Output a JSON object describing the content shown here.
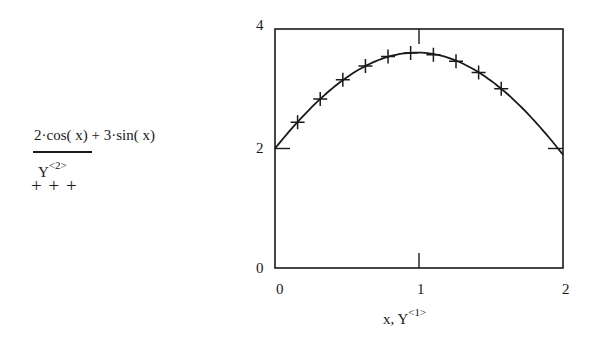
{
  "legend": {
    "series1_expr": "2·cos( x) + 3·sin( x)",
    "series1_style": "solid-line",
    "series2_base": "Y",
    "series2_sup": "<2>",
    "series2_markers": "+ + +"
  },
  "axes": {
    "xlabel_base": "x, Y",
    "xlabel_sup": "<1>",
    "x_ticks": [
      "0",
      "1",
      "2"
    ],
    "y_ticks": [
      "0",
      "2",
      "4"
    ]
  },
  "chart_data": {
    "type": "line",
    "title": "",
    "xlabel": "x, Y<1>",
    "ylabel": "2·cos(x) + 3·sin(x), Y<2>",
    "xlim": [
      0,
      2
    ],
    "ylim": [
      0,
      4
    ],
    "grid": false,
    "legend_position": "left",
    "series": [
      {
        "name": "2·cos(x) + 3·sin(x)",
        "style": "line",
        "x": [
          0,
          0.1,
          0.2,
          0.3,
          0.4,
          0.5,
          0.6,
          0.7,
          0.8,
          0.9,
          1.0,
          1.1,
          1.2,
          1.3,
          1.4,
          1.5,
          1.6,
          1.7,
          1.8,
          1.9,
          2.0
        ],
        "y": [
          2.0,
          2.29,
          2.56,
          2.8,
          3.01,
          3.19,
          3.34,
          3.46,
          3.55,
          3.59,
          3.6,
          3.57,
          3.52,
          3.43,
          3.28,
          3.13,
          2.94,
          2.73,
          2.49,
          2.22,
          1.9
        ]
      },
      {
        "name": "Y<2>",
        "style": "markers-plus",
        "x": [
          0.157,
          0.314,
          0.471,
          0.628,
          0.785,
          0.942,
          1.1,
          1.257,
          1.414,
          1.571
        ],
        "y": [
          2.44,
          2.83,
          3.15,
          3.38,
          3.54,
          3.6,
          3.57,
          3.46,
          3.27,
          3.0
        ]
      }
    ]
  }
}
